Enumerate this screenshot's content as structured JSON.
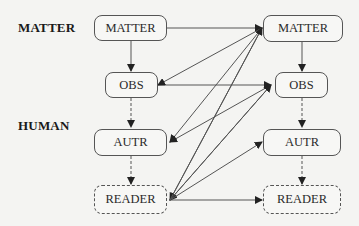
{
  "row_labels": {
    "matter": "MATTER",
    "human": "HUMAN"
  },
  "left_column": {
    "matter": "MATTER",
    "obs": "OBS",
    "autr": "AUTR",
    "reader": "READER"
  },
  "right_column": {
    "matter": "MATTER",
    "obs": "OBS",
    "autr": "AUTR",
    "reader": "READER"
  },
  "edges": [
    {
      "from": "left.matter",
      "to": "left.obs",
      "style": "solid"
    },
    {
      "from": "left.obs",
      "to": "left.autr",
      "style": "dashed"
    },
    {
      "from": "left.autr",
      "to": "left.reader",
      "style": "dashed"
    },
    {
      "from": "right.matter",
      "to": "right.obs",
      "style": "solid"
    },
    {
      "from": "right.obs",
      "to": "right.autr",
      "style": "dashed"
    },
    {
      "from": "right.autr",
      "to": "right.reader",
      "style": "dashed"
    },
    {
      "from": "left.matter",
      "to": "right.matter",
      "style": "solid"
    },
    {
      "from": "left.obs",
      "to": "right.obs",
      "style": "solid"
    },
    {
      "from": "right.matter",
      "to": "left.obs",
      "style": "solid"
    },
    {
      "from": "right.matter",
      "to": "left.autr",
      "style": "solid"
    },
    {
      "from": "right.matter",
      "to": "left.reader",
      "style": "solid"
    },
    {
      "from": "right.obs",
      "to": "left.autr",
      "style": "solid"
    },
    {
      "from": "right.obs",
      "to": "left.reader",
      "style": "solid"
    },
    {
      "from": "left.reader",
      "to": "right.matter",
      "style": "solid"
    },
    {
      "from": "left.reader",
      "to": "right.obs",
      "style": "solid"
    },
    {
      "from": "left.reader",
      "to": "right.autr",
      "style": "solid"
    },
    {
      "from": "left.reader",
      "to": "right.reader",
      "style": "solid"
    }
  ],
  "colors": {
    "background": "#f4f4f2",
    "stroke": "#555555",
    "text": "#2a2a2a"
  }
}
